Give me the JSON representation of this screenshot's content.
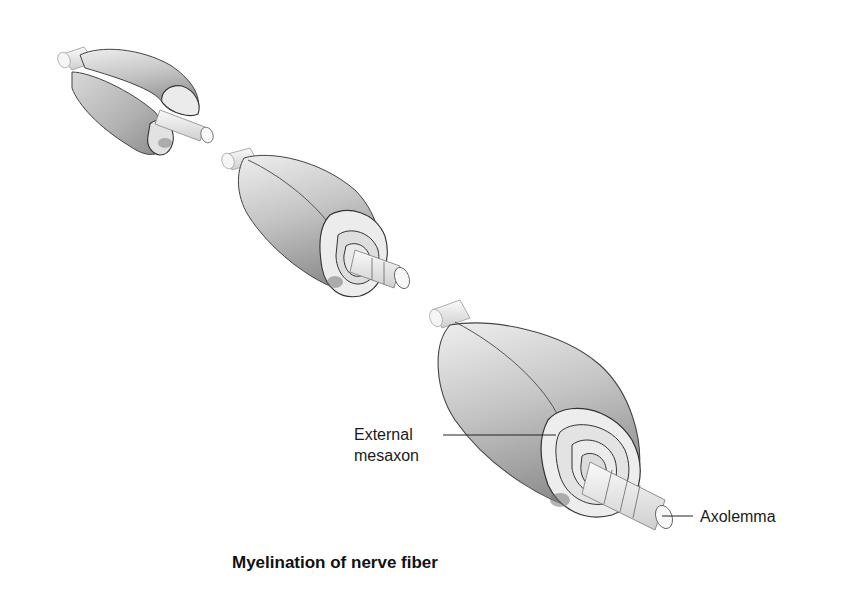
{
  "diagram": {
    "title": "Myelination of nerve fiber",
    "stages": [
      {
        "name": "stage-1",
        "description": "Schwann cell beginning to wrap around axon"
      },
      {
        "name": "stage-2",
        "description": "Schwann cell membrane wrapped in several layers"
      },
      {
        "name": "stage-3",
        "description": "Mature myelin sheath with multiple concentric layers"
      }
    ],
    "labels": {
      "external_mesaxon_line1": "External",
      "external_mesaxon_line2": "mesaxon",
      "axolemma": "Axolemma"
    },
    "colors": {
      "sheath_light": "#e8e8e8",
      "sheath_mid": "#bdbdbd",
      "sheath_dark": "#8f8f8f",
      "axon": "#f0f0f0",
      "outline": "#333333",
      "text": "#1a1a1a"
    }
  }
}
